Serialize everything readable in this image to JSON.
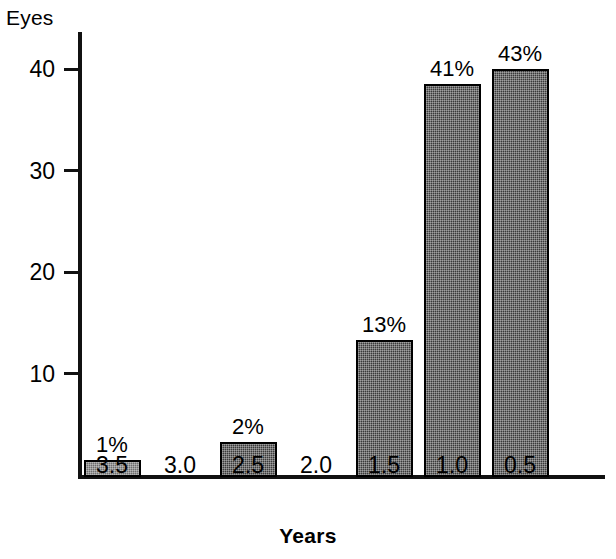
{
  "chart_data": {
    "type": "bar",
    "title": "",
    "xlabel": "Years",
    "ylabel": "Eyes",
    "categories": [
      "3.5",
      "3.0",
      "2.5",
      "2.0",
      "1.5",
      "1.0",
      "0.5"
    ],
    "values": [
      1.7,
      0,
      3.4,
      0,
      13.5,
      38.7,
      40.2
    ],
    "data_labels": [
      "1%",
      "",
      "2%",
      "",
      "13%",
      "41%",
      "43%"
    ],
    "ylim": [
      0,
      44
    ],
    "yticks": [
      10,
      20,
      30,
      40
    ],
    "ytick_labels": [
      "10",
      "20",
      "30",
      "40"
    ],
    "grid": false,
    "legend": false,
    "bar_fill": "#3a3a3a",
    "bar_fill_light": "#6d6d6d",
    "bar_edge": "#000000",
    "axis_color": "#111111",
    "background": "#ffffff",
    "bars": [
      {
        "category": "3.5",
        "value": 1.7,
        "label": "1%",
        "shade": "light"
      },
      {
        "category": "3.0",
        "value": 0,
        "label": "",
        "shade": "dark"
      },
      {
        "category": "2.5",
        "value": 3.4,
        "label": "2%",
        "shade": "dark"
      },
      {
        "category": "2.0",
        "value": 0,
        "label": "",
        "shade": "dark"
      },
      {
        "category": "1.5",
        "value": 13.5,
        "label": "13%",
        "shade": "dark"
      },
      {
        "category": "1.0",
        "value": 38.7,
        "label": "41%",
        "shade": "dark"
      },
      {
        "category": "0.5",
        "value": 40.2,
        "label": "43%",
        "shade": "dark"
      }
    ]
  }
}
